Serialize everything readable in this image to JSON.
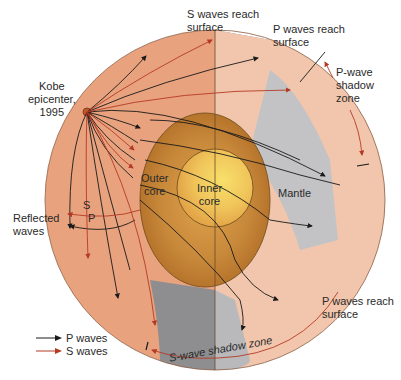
{
  "diagram": {
    "colors": {
      "mantle_left": "#e8a27e",
      "mantle_right": "#f1c6ac",
      "outer_core": "#c98a3a",
      "inner_core": "#f0c45a",
      "shadow_gray": "#b9b9bb",
      "shadow_gray_dark": "#8e8e90",
      "ocean_blue": "#4a6fb0",
      "land_green": "#3f8a2e",
      "p_wave": "#1a1a1a",
      "s_wave": "#b53a25"
    },
    "labels": {
      "epicenter": "Kobe\nepicenter,\n1995",
      "epicenter_line1": "Kobe",
      "epicenter_line2": "epicenter,",
      "epicenter_line3": "1995",
      "s_reach_line1": "S waves reach",
      "s_reach_line2": "surface",
      "p_reach_top_line1": "P waves reach",
      "p_reach_top_line2": "surface",
      "p_shadow_line1": "P-wave",
      "p_shadow_line2": "shadow",
      "p_shadow_line3": "zone",
      "outer_core_line1": "Outer",
      "outer_core_line2": "core",
      "inner_core_line1": "Inner",
      "inner_core_line2": "core",
      "mantle": "Mantle",
      "reflected_line1": "Reflected",
      "reflected_line2": "waves",
      "reflected_s": "S",
      "reflected_p": "P",
      "p_reach_bottom_line1": "P waves reach",
      "p_reach_bottom_line2": "surface",
      "s_shadow": "S-wave shadow zone"
    },
    "legend": [
      {
        "label": "P waves",
        "color": "#1a1a1a"
      },
      {
        "label": "S waves",
        "color": "#b53a25"
      }
    ]
  }
}
